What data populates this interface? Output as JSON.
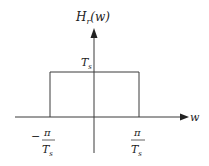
{
  "diagram": {
    "y_axis_label": {
      "main": "H",
      "sub": "r",
      "arg": "(w)"
    },
    "x_axis_label": "w",
    "amplitude_label": {
      "main": "T",
      "sub": "s"
    },
    "left_cutoff": {
      "sign": "−",
      "numerator": "π",
      "denominator_main": "T",
      "denominator_sub": "s"
    },
    "right_cutoff": {
      "numerator": "π",
      "denominator_main": "T",
      "denominator_sub": "s"
    },
    "colors": {
      "line": "#3a3a3a",
      "background": "#ffffff"
    }
  }
}
